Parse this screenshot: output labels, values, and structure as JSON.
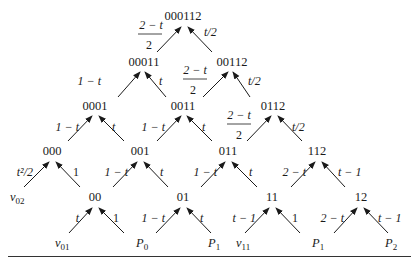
{
  "diagram": {
    "nodes": {
      "n000112": "000112",
      "n00011": "00011",
      "n00112": "00112",
      "n0001": "0001",
      "n0011": "0011",
      "n0112": "0112",
      "n000": "000",
      "n001": "001",
      "n011": "011",
      "n112": "112",
      "n00": "00",
      "n01": "01",
      "n11": "11",
      "n12": "12"
    },
    "leaves": {
      "v02": {
        "base": "v",
        "sub": "02"
      },
      "v01": {
        "base": "v",
        "sub": "01"
      },
      "p0": {
        "base": "P",
        "sub": "0"
      },
      "p1a": {
        "base": "P",
        "sub": "1"
      },
      "v11": {
        "base": "v",
        "sub": "11"
      },
      "p1b": {
        "base": "P",
        "sub": "1"
      },
      "p2": {
        "base": "P",
        "sub": "2"
      }
    },
    "edge_labels": {
      "e_00011_000112": {
        "num": "2 − t",
        "den": "2"
      },
      "e_00112_000112": "t/2",
      "e_0001_00011": "1 − t",
      "e_0011_00011": "t",
      "e_0011_00112": {
        "num": "2 − t",
        "den": "2"
      },
      "e_0112_00112": "t/2",
      "e_000_0001": "1 − t",
      "e_001_0001": "t",
      "e_001_0011": "1 − t",
      "e_011_0011": "t",
      "e_011_0112": {
        "num": "2 − t",
        "den": "2"
      },
      "e_112_0112": "t/2",
      "e_v02_000": "t²/2",
      "e_00_000": "1",
      "e_00_001": "1 − t",
      "e_01_001": "t",
      "e_01_011": "1 − t",
      "e_11_011": "t",
      "e_11_112": "2 − t",
      "e_12_112": "t − 1",
      "e_v01_00": "t",
      "e_p0_00": "1",
      "e_p0_01": "1 − t",
      "e_p1_01": "t",
      "e_v11_11": "t − 1",
      "e_p1_11": "1",
      "e_p1_12": "2 − t",
      "e_p2_12": "t − 1"
    }
  }
}
